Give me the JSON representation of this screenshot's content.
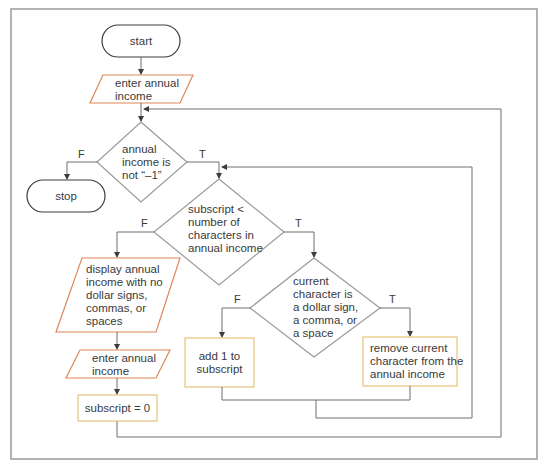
{
  "diagram": {
    "type": "flowchart",
    "colors": {
      "frame": "#9a9a9a",
      "line": "#6e6e6e",
      "terminator_stroke": "#3c3c3c",
      "io_stroke": "#e0865a",
      "process_stroke": "#e8c27a",
      "decision_stroke": "#9a9a9a",
      "text": "#3a3a3a"
    },
    "nodes": {
      "start": {
        "shape": "terminator",
        "lines": [
          "start"
        ]
      },
      "input1": {
        "shape": "parallelogram",
        "lines": [
          "enter annual",
          "income"
        ]
      },
      "decision1": {
        "shape": "diamond",
        "lines": [
          "annual",
          "income is",
          "not “–1”"
        ],
        "false_label": "F",
        "true_label": "T"
      },
      "stop": {
        "shape": "terminator",
        "lines": [
          "stop"
        ]
      },
      "decision2": {
        "shape": "diamond",
        "lines": [
          "subscript <",
          "number of",
          "characters in",
          "annual income"
        ],
        "false_label": "F",
        "true_label": "T"
      },
      "display": {
        "shape": "parallelogram",
        "lines": [
          "display annual",
          "income with no",
          "dollar signs,",
          "commas, or",
          "spaces"
        ]
      },
      "input2": {
        "shape": "parallelogram",
        "lines": [
          "enter annual",
          "income"
        ]
      },
      "reset": {
        "shape": "process",
        "lines": [
          "subscript = 0"
        ]
      },
      "decision3": {
        "shape": "diamond",
        "lines": [
          "current",
          "character is",
          "a dollar sign,",
          "a comma, or",
          "a space"
        ],
        "false_label": "F",
        "true_label": "T"
      },
      "add": {
        "shape": "process",
        "lines": [
          "add 1 to",
          "subscript"
        ]
      },
      "remove": {
        "shape": "process",
        "lines": [
          "remove current",
          "character from the",
          "annual income"
        ]
      }
    }
  }
}
